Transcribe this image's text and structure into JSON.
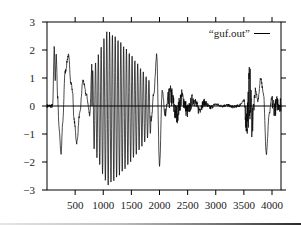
{
  "chart_data": {
    "type": "line",
    "title": "",
    "xlabel": "",
    "ylabel": "",
    "xlim": [
      0,
      4160
    ],
    "ylim": [
      -3,
      3
    ],
    "grid": false,
    "legend_position": "top-right (inside)",
    "x_ticks": [
      500,
      1000,
      1500,
      2000,
      2500,
      3000,
      3500,
      4000
    ],
    "x_tick_labels": [
      "500",
      "1000",
      "1500",
      "2000",
      "2500",
      "3000",
      "3500",
      "4000"
    ],
    "y_ticks": [
      -3,
      -2,
      -1,
      0,
      1,
      2,
      3
    ],
    "y_tick_labels": [
      "-3",
      "-2",
      "-1",
      "0",
      "1",
      "2",
      "3"
    ],
    "zero_line": true,
    "series": [
      {
        "name": "“guf.out”",
        "color": "#000000",
        "sample_points": {
          "x": [
            0,
            100,
            130,
            145,
            165,
            190,
            215,
            250,
            280,
            320,
            380,
            430,
            455,
            480,
            530,
            580,
            640,
            700,
            760,
            800,
            830,
            860,
            900,
            1000,
            1100,
            1200,
            1300,
            1400,
            1500,
            1600,
            1700,
            1800,
            1850,
            1900,
            1950,
            2000,
            2050,
            2100,
            2200,
            2300,
            2400,
            2500,
            2600,
            2700,
            2800,
            2900,
            3000,
            3100,
            3200,
            3300,
            3400,
            3500,
            3550,
            3600,
            3650,
            3700,
            3750,
            3800,
            3850,
            3900,
            3950,
            4000,
            4050,
            4100,
            4160
          ],
          "y": [
            0,
            0,
            2.1,
            0.9,
            1.8,
            0.3,
            -0.8,
            -1.7,
            -0.6,
            1.2,
            1.8,
            0.8,
            0.5,
            -0.5,
            -1.3,
            -0.3,
            0.9,
            0.4,
            -0.3,
            1.5,
            -2.2,
            2.4,
            -2.8,
            2.6,
            -2.8,
            2.6,
            -2.7,
            2.5,
            -2.3,
            2.0,
            -1.6,
            1.0,
            -0.6,
            0.5,
            1.8,
            -2.1,
            0.6,
            -0.4,
            0.6,
            -0.5,
            0.5,
            -0.3,
            0.4,
            -0.2,
            0.2,
            -0.1,
            0.1,
            0.0,
            0.05,
            -0.05,
            0.0,
            0.3,
            -1.0,
            1.0,
            -0.8,
            0.6,
            0.2,
            1.0,
            0.4,
            -1.7,
            -0.3,
            0.3,
            -0.2,
            0.3,
            0.2
          ]
        }
      }
    ],
    "burst_regions": [
      {
        "x_start": 800,
        "x_end": 1850,
        "description": "dense oscillation, peak amplitude ~2.6 / -2.9",
        "cycles": 21
      },
      {
        "x_start": 3500,
        "x_end": 3700,
        "description": "dense spike cluster amplitude ~1.0"
      },
      {
        "x_start": 4000,
        "x_end": 4160,
        "description": "small cluster amplitude ~0.3"
      }
    ]
  },
  "legend": {
    "label": "“guf.out”"
  }
}
